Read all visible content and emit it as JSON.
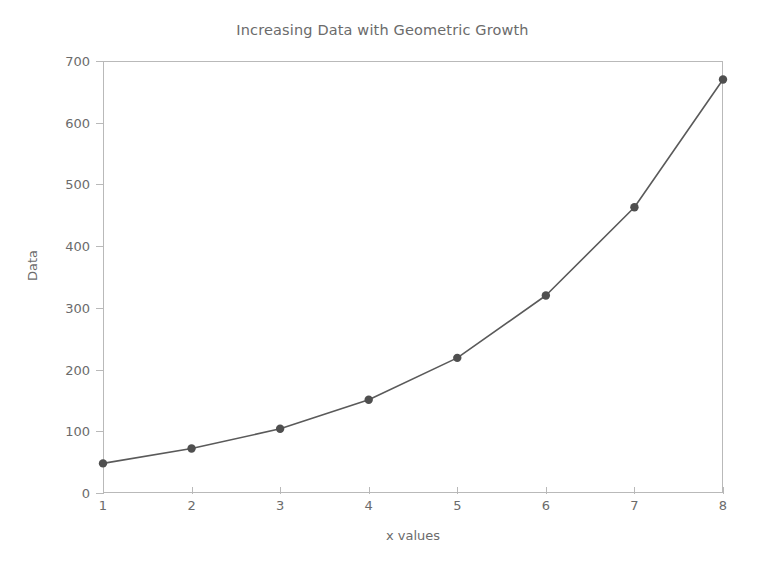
{
  "chart_data": {
    "type": "line",
    "title": "Increasing Data with Geometric Growth",
    "xlabel": "x values",
    "ylabel": "Data",
    "x": [
      1,
      2,
      3,
      4,
      5,
      6,
      7,
      8
    ],
    "values": [
      48,
      72,
      104,
      151,
      219,
      320,
      463,
      670
    ],
    "series": [
      {
        "name": "Data",
        "values": [
          48,
          72,
          104,
          151,
          219,
          320,
          463,
          670
        ]
      }
    ],
    "xtick_labels": [
      "1",
      "2",
      "3",
      "4",
      "5",
      "6",
      "7",
      "8"
    ],
    "ytick_labels": [
      "0",
      "100",
      "200",
      "300",
      "400",
      "500",
      "600",
      "700"
    ],
    "ytick_values": [
      0,
      100,
      200,
      300,
      400,
      500,
      600,
      700
    ],
    "xlim": [
      1,
      8
    ],
    "ylim": [
      0,
      700
    ],
    "grid": false,
    "legend": false,
    "marker": "circle",
    "line_color": "#5a5a5a",
    "marker_color": "#4f4f4f",
    "axis_color": "#b9b9b9",
    "text_color": "#6b6b6b",
    "background_color": "#ffffff"
  }
}
